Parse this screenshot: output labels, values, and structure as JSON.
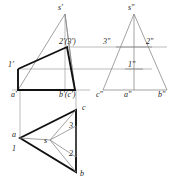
{
  "drawing": {
    "title": "Orthographic three-view projection of a triangular pyramid with section line",
    "type": "engineering-orthographic-projection",
    "colors": {
      "background": "#ffffff",
      "thin_line": "#8c8c8c",
      "projection_line": "#9a9a9a",
      "bold_line": "#111111",
      "text": "#1a1a1a"
    },
    "views": {
      "front": {
        "name": "front-view",
        "labels": [
          {
            "id": "s-prime",
            "text": "s'",
            "x": 58,
            "y": 4
          },
          {
            "id": "two-three-prime",
            "text": "2'(3')",
            "x": 60,
            "y": 39
          },
          {
            "id": "one-prime",
            "text": "1'",
            "x": 8,
            "y": 62
          },
          {
            "id": "a-prime",
            "text": "a'",
            "x": 10,
            "y": 92
          },
          {
            "id": "b-c-prime",
            "text": "b'(c')",
            "x": 60,
            "y": 92
          }
        ]
      },
      "side": {
        "name": "side-view",
        "labels": [
          {
            "id": "s-dprime",
            "text": "s\"",
            "x": 128,
            "y": 4
          },
          {
            "id": "three-dprime",
            "text": "3\"",
            "x": 104,
            "y": 39
          },
          {
            "id": "two-dprime",
            "text": "2\"",
            "x": 147,
            "y": 39
          },
          {
            "id": "one-dprime",
            "text": "1\"",
            "x": 129,
            "y": 64
          },
          {
            "id": "c-dprime",
            "text": "c\"",
            "x": 96,
            "y": 92
          },
          {
            "id": "a-dprime",
            "text": "a\"",
            "x": 124,
            "y": 92
          },
          {
            "id": "b-dprime",
            "text": "b\"",
            "x": 158,
            "y": 92
          }
        ]
      },
      "top": {
        "name": "top-view",
        "labels": [
          {
            "id": "c-top",
            "text": "c",
            "x": 83,
            "y": 105
          },
          {
            "id": "three-top",
            "text": "3",
            "x": 71,
            "y": 128
          },
          {
            "id": "a-top",
            "text": "a",
            "x": 12,
            "y": 134
          },
          {
            "id": "s-top",
            "text": "s",
            "x": 44,
            "y": 140
          },
          {
            "id": "one-top",
            "text": "1",
            "x": 12,
            "y": 149
          },
          {
            "id": "two-top",
            "text": "2",
            "x": 70,
            "y": 155
          },
          {
            "id": "b-top",
            "text": "b",
            "x": 80,
            "y": 174
          }
        ]
      }
    },
    "geometry": {
      "front": {
        "apex": [
          65,
          14
        ],
        "base_left": [
          18,
          90
        ],
        "base_right": [
          75,
          90
        ],
        "pt1": [
          18,
          69
        ],
        "pt23": [
          67,
          47
        ]
      },
      "side": {
        "apex": [
          134,
          14
        ],
        "base_left": [
          103,
          90
        ],
        "base_right": [
          167,
          90
        ],
        "pt3": [
          116,
          47
        ],
        "pt2": [
          152,
          47
        ],
        "pt1": [
          134,
          69
        ]
      },
      "top": {
        "a": [
          20,
          138
        ],
        "b": [
          76,
          172
        ],
        "c": [
          76,
          110
        ],
        "s": [
          50,
          140
        ],
        "pt1": [
          20,
          138
        ],
        "pt2": [
          76,
          157
        ],
        "pt3": [
          76,
          126
        ]
      }
    }
  }
}
